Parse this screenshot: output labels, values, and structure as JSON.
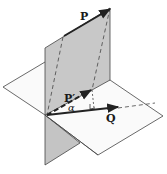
{
  "diagram": {
    "type": "vector-projection-3d",
    "labels": {
      "p": "P",
      "p_prime": "P′",
      "q": "Q",
      "angle": "α"
    },
    "colors": {
      "vertical_plane_fill": "#c8c8c8",
      "vertical_plane_lower_fill": "#b8b8b8",
      "horizontal_plane_fill": "#ffffff",
      "stroke": "#333333",
      "vector": "#222222"
    }
  }
}
